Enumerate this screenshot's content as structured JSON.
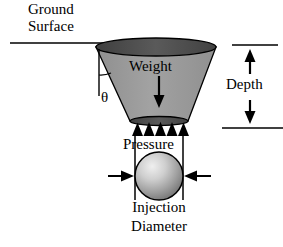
{
  "figure": {
    "type": "engineering-cross-section-diagram",
    "background_color": "#ffffff",
    "line_color": "#000000"
  },
  "labels": {
    "ground_surface_line1": "Ground",
    "ground_surface_line2": "Surface",
    "weight": "Weight",
    "theta": "θ",
    "pressure": "Pressure",
    "depth": "Depth",
    "injection_line1": "Injection",
    "injection_line2": "Diameter"
  },
  "colors": {
    "cone_body_fill": "#9a9a9a",
    "cone_top_rim_fill": "#4d4d4d",
    "cone_bottom_rim_fill": "#4d4d4d",
    "sphere_highlight": "#e8e8e8",
    "sphere_shadow": "#6b6b6b",
    "outline": "#000000",
    "text": "#000000"
  },
  "shapes": {
    "ground_surface_line": {
      "x1": 10,
      "y1": 43,
      "x2": 103,
      "y2": 43
    },
    "cone": {
      "top_left_x": 96,
      "top_right_x": 216,
      "top_y": 47,
      "bottom_left_x": 130,
      "bottom_right_x": 188,
      "bottom_y": 121,
      "top_ellipse_rx": 60,
      "top_ellipse_ry": 9,
      "bottom_ellipse_rx": 29,
      "bottom_ellipse_ry": 4
    },
    "weight_arrow": {
      "x": 159,
      "y_top": 76,
      "y_bottom": 106
    },
    "theta_guide_line": {
      "x": 99,
      "y_top": 50,
      "y_bottom": 95
    },
    "theta_arc_radius": 26,
    "pressure_triangles": {
      "count": 5,
      "row_y_base": 136,
      "row_y_apex": 123,
      "x_start": 132,
      "x_end": 187
    },
    "sphere": {
      "cx": 159,
      "cy": 176,
      "r": 24
    },
    "diameter_guides": {
      "left_x": 135,
      "right_x": 183,
      "y_top": 133,
      "y_bottom": 200
    },
    "diameter_arrows": {
      "y": 176,
      "left_tail_x": 108,
      "right_tail_x": 211
    },
    "depth_annotation": {
      "top_line": {
        "x1": 232,
        "y1": 45,
        "x2": 278,
        "y2": 45
      },
      "bottom_line": {
        "x1": 222,
        "y1": 128,
        "x2": 283,
        "y2": 128
      },
      "arrow_x": 250,
      "up_arrow": {
        "y_tip": 50,
        "y_tail": 74
      },
      "down_arrow": {
        "y_tip": 124,
        "y_tail": 100
      }
    }
  }
}
